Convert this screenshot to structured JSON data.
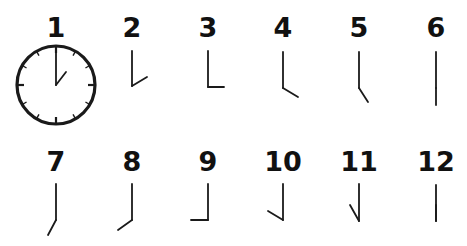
{
  "diagram": {
    "type": "clock-hand-sequence",
    "stroke_color": "#1a1a1a",
    "background": "#ffffff",
    "items": [
      {
        "label": "1",
        "x": 56,
        "label_y": 37,
        "hour_hand_to": [
          66,
          72
        ],
        "hand_top": 47,
        "hand_pivot": 85,
        "full_clock": true
      },
      {
        "label": "2",
        "x": 132,
        "label_y": 37,
        "hour_hand_to": [
          147,
          77
        ],
        "hand_top": 51,
        "hand_pivot": 86,
        "full_clock": false
      },
      {
        "label": "3",
        "x": 208,
        "label_y": 37,
        "hour_hand_to": [
          224,
          87
        ],
        "hand_top": 51,
        "hand_pivot": 87,
        "full_clock": false
      },
      {
        "label": "4",
        "x": 283,
        "label_y": 37,
        "hour_hand_to": [
          298,
          97
        ],
        "hand_top": 52,
        "hand_pivot": 88,
        "full_clock": false
      },
      {
        "label": "5",
        "x": 359,
        "label_y": 37,
        "hour_hand_to": [
          368,
          102
        ],
        "hand_top": 52,
        "hand_pivot": 88,
        "full_clock": false
      },
      {
        "label": "6",
        "x": 436,
        "label_y": 37,
        "hour_hand_to": [
          436,
          105
        ],
        "hand_top": 52,
        "hand_pivot": 88,
        "full_clock": false
      },
      {
        "label": "7",
        "x": 56,
        "label_y": 171,
        "hour_hand_to": [
          48,
          235
        ],
        "hand_top": 184,
        "hand_pivot": 220,
        "full_clock": false
      },
      {
        "label": "8",
        "x": 132,
        "label_y": 171,
        "hour_hand_to": [
          118,
          230
        ],
        "hand_top": 184,
        "hand_pivot": 220,
        "full_clock": false
      },
      {
        "label": "9",
        "x": 208,
        "label_y": 171,
        "hour_hand_to": [
          191,
          220
        ],
        "hand_top": 184,
        "hand_pivot": 220,
        "full_clock": false
      },
      {
        "label": "10",
        "x": 283,
        "label_y": 171,
        "hour_hand_to": [
          268,
          211
        ],
        "hand_top": 184,
        "hand_pivot": 220,
        "full_clock": false
      },
      {
        "label": "11",
        "x": 359,
        "label_y": 171,
        "hour_hand_to": [
          350,
          205
        ],
        "hand_top": 184,
        "hand_pivot": 221,
        "full_clock": false
      },
      {
        "label": "12",
        "x": 436,
        "label_y": 171,
        "hour_hand_to": [
          436,
          205
        ],
        "hand_top": 185,
        "hand_pivot": 221,
        "full_clock": false
      }
    ],
    "clock_face": {
      "cx": 56,
      "cy": 85,
      "r": 39,
      "tick_count": 12
    }
  }
}
